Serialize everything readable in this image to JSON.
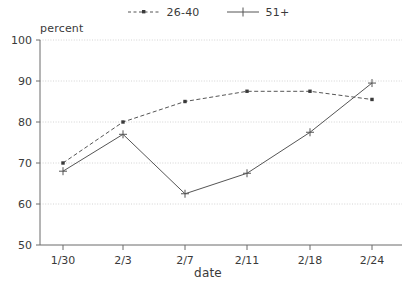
{
  "chart_data": {
    "type": "line",
    "title": "",
    "xlabel": "date",
    "ylabel": "percent",
    "categories": [
      "1/30",
      "2/3",
      "2/7",
      "2/11",
      "2/18",
      "2/24"
    ],
    "ylim": [
      50,
      100
    ],
    "yticks": [
      50,
      60,
      70,
      80,
      90,
      100
    ],
    "ytick_labels": [
      "50",
      "60",
      "70",
      "80",
      "90",
      "100"
    ],
    "grid": true,
    "legend_position": "top-center",
    "series": [
      {
        "name": "26-40",
        "style": "dashed",
        "marker": "square",
        "color": "#555555",
        "values": [
          70,
          80,
          85,
          87.5,
          87.5,
          85.5
        ]
      },
      {
        "name": "51+",
        "style": "solid",
        "marker": "plus",
        "color": "#555555",
        "values": [
          68,
          77,
          62.5,
          67.5,
          77.5,
          89.5
        ]
      }
    ]
  },
  "legend": {
    "entries": [
      {
        "label": "26-40",
        "swatch": "dashed-square-marker"
      },
      {
        "label": "51+",
        "swatch": "solid-plus-marker"
      }
    ]
  },
  "axes": {
    "y_title": "percent",
    "x_title": "date",
    "y_tick_labels": [
      "100",
      "90",
      "80",
      "70",
      "60",
      "50"
    ],
    "x_tick_labels": [
      "1/30",
      "2/3",
      "2/7",
      "2/11",
      "2/18",
      "2/24"
    ]
  },
  "colors": {
    "ink": "#3a3a3a",
    "line": "#555555",
    "grid": "#c9c9c9",
    "axis": "#6b6b6b",
    "background": "#ffffff"
  }
}
